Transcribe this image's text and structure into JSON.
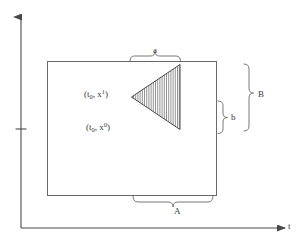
{
  "figure": {
    "type": "geometric-diagram",
    "background_color": "#ffffff",
    "stroke_color": "#555555",
    "text_color": "#3a3a3a"
  },
  "axes": {
    "vertical": {
      "name": "x-axis",
      "label": "",
      "has_arrowhead": true,
      "has_tick": true
    },
    "horizontal": {
      "name": "t-axis",
      "label": "t",
      "has_arrowhead": true
    }
  },
  "shapes": {
    "rectangle": {
      "name": "domain-rectangle",
      "filled": false
    },
    "triangle": {
      "name": "hatched-cone",
      "orientation": "points-left",
      "hatch_style": "vertical-lines",
      "hatch_count": 22
    }
  },
  "points": {
    "upper": {
      "base": "(t",
      "sub": "0",
      "mid": ", x",
      "sup": "1",
      "close": ")",
      "full_text": "(t0, x1)"
    },
    "lower": {
      "base": "(t",
      "sub": "0",
      "mid": ", x",
      "sup": "0",
      "close": ")",
      "full_text": "(t0, x0)"
    }
  },
  "braces": {
    "top_small": {
      "name": "brace-a",
      "label": "a",
      "orientation": "horizontal-top"
    },
    "right_small": {
      "name": "brace-b",
      "label": "b",
      "orientation": "vertical-right"
    },
    "bottom_large": {
      "name": "brace-A",
      "label": "A",
      "orientation": "horizontal-bottom"
    },
    "right_large": {
      "name": "brace-B",
      "label": "B",
      "orientation": "vertical-right"
    }
  }
}
